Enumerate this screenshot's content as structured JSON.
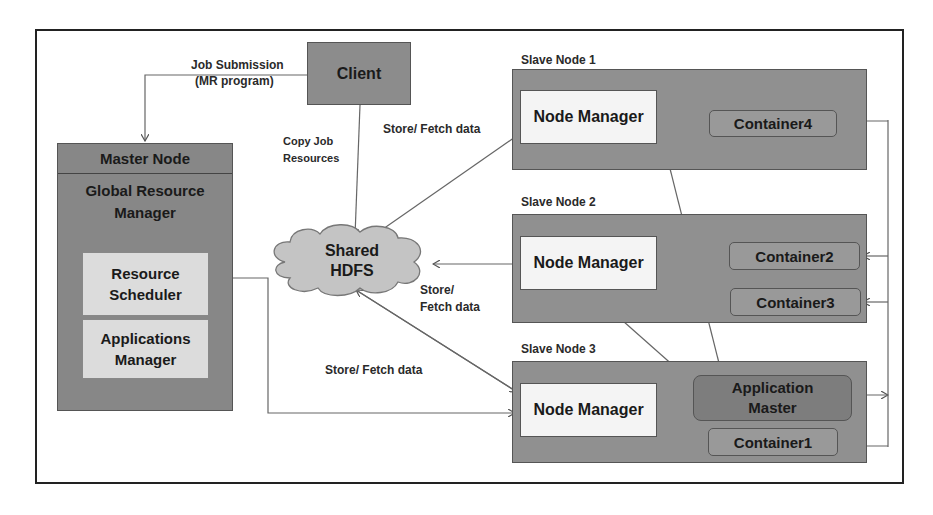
{
  "diagram": {
    "client": {
      "label": "Client"
    },
    "master_node": {
      "title": "Master Node",
      "global_rm": "Global Resource Manager",
      "resource_scheduler": "Resource Scheduler",
      "applications_manager": "Applications Manager"
    },
    "shared_hdfs": {
      "line1": "Shared",
      "line2": "HDFS"
    },
    "slave_nodes": [
      {
        "title": "Slave Node 1",
        "node_manager": "Node Manager",
        "containers": [
          "Container4"
        ]
      },
      {
        "title": "Slave Node 2",
        "node_manager": "Node Manager",
        "containers": [
          "Container2",
          "Container3"
        ]
      },
      {
        "title": "Slave Node 3",
        "node_manager": "Node Manager",
        "application_master": "Application Master",
        "containers": [
          "Container1"
        ]
      }
    ],
    "edge_labels": {
      "job_submission_1": "Job Submission",
      "job_submission_2": "(MR program)",
      "copy_job_1": "Copy Job",
      "copy_job_2": "Resources",
      "store_fetch_1": "Store/ Fetch data",
      "store_fetch_2a": "Store/",
      "store_fetch_2b": "Fetch data",
      "store_fetch_3": "Store/ Fetch data"
    }
  }
}
